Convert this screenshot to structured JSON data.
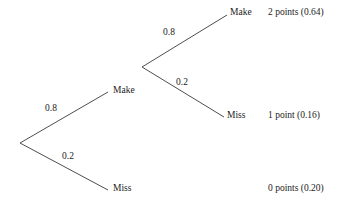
{
  "figure": {
    "type": "probability-tree",
    "background_color": "#ffffff",
    "line_color": "#3a3a3a",
    "text_color": "#1a1a1a"
  },
  "chart_data": {
    "type": "diagram",
    "title": "",
    "root": {
      "x": 20,
      "y": 143
    },
    "nodes": [
      {
        "id": "make1",
        "label": "Make",
        "x": 113,
        "y": 86,
        "level": 1
      },
      {
        "id": "miss1",
        "label": "Miss",
        "x": 113,
        "y": 184,
        "level": 1
      },
      {
        "id": "make2",
        "label": "Make",
        "x": 230,
        "y": 8,
        "level": 2
      },
      {
        "id": "miss2",
        "label": "Miss",
        "x": 227,
        "y": 111,
        "level": 2
      }
    ],
    "edges": [
      {
        "from": "root",
        "to": "make1",
        "x1": 20,
        "y1": 143,
        "x2": 108,
        "y2": 92,
        "probability": "0.8",
        "label_x": 45,
        "label_y": 104
      },
      {
        "from": "root",
        "to": "miss1",
        "x1": 20,
        "y1": 143,
        "x2": 108,
        "y2": 190,
        "probability": "0.2",
        "label_x": 62,
        "label_y": 152
      },
      {
        "from": "make1",
        "to": "make2",
        "x1": 142,
        "y1": 67,
        "x2": 227,
        "y2": 15,
        "probability": "0.8",
        "label_x": 163,
        "label_y": 28
      },
      {
        "from": "make1",
        "to": "miss2",
        "x1": 142,
        "y1": 67,
        "x2": 224,
        "y2": 117,
        "probability": "0.2",
        "label_x": 176,
        "label_y": 78
      }
    ],
    "inner_vertex": {
      "x": 142,
      "y": 67
    },
    "outcomes": [
      {
        "id": "outcome-2pts",
        "text": "2 points (0.64)",
        "points": 2,
        "probability": 0.64,
        "x": 268,
        "y": 8
      },
      {
        "id": "outcome-1pt",
        "text": "1 point (0.16)",
        "points": 1,
        "probability": 0.16,
        "x": 268,
        "y": 111
      },
      {
        "id": "outcome-0pts",
        "text": "0 points (0.20)",
        "points": 0,
        "probability": 0.2,
        "x": 268,
        "y": 184
      }
    ]
  }
}
